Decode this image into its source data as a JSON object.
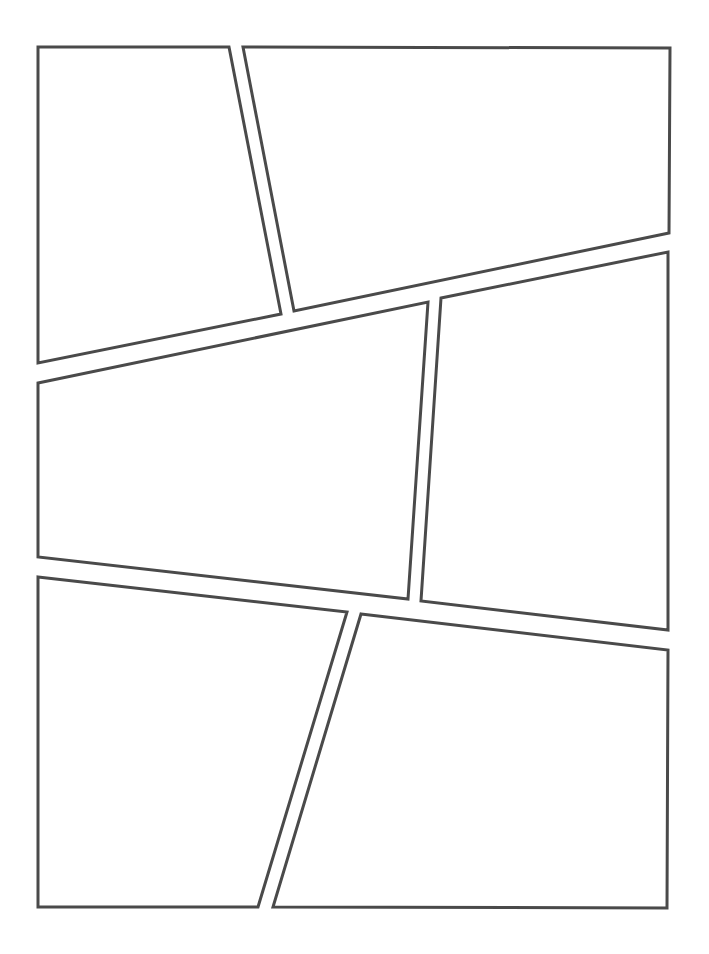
{
  "page": {
    "width": 709,
    "height": 954,
    "background": "#ffffff",
    "stroke_color": "#4a4a4a",
    "stroke_width": 3
  },
  "panels": [
    {
      "id": 1,
      "points": "38,47 229,47 281,314 38,363"
    },
    {
      "id": 2,
      "points": "243,47 670,48 669,233 294,311"
    },
    {
      "id": 3,
      "points": "38,383 428,302 408,599 38,557"
    },
    {
      "id": 4,
      "points": "441,298 668,252 668,630 421,601"
    },
    {
      "id": 5,
      "points": "38,577 347,612 258,907 38,907"
    },
    {
      "id": 6,
      "points": "361,614 668,650 667,908 273,907"
    }
  ]
}
